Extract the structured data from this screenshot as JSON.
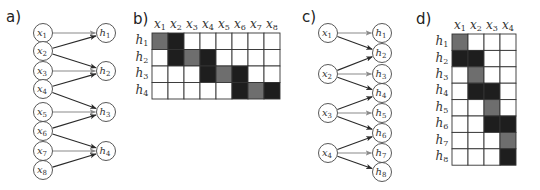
{
  "colors": {
    "dark": "#1e1e1e",
    "gray": "#6e6e6e",
    "empty": "#ffffff",
    "edge_dark": "#2a2a2a",
    "edge_gray": "#8a8a8a"
  },
  "panels": [
    {
      "id": "a",
      "label": "a)"
    },
    {
      "id": "b",
      "label": "b)"
    },
    {
      "id": "c",
      "label": "c)"
    },
    {
      "id": "d",
      "label": "d)"
    }
  ],
  "panel_a": {
    "inputs": [
      "x1",
      "x2",
      "x3",
      "x4",
      "x5",
      "x6",
      "x7",
      "x8"
    ],
    "outputs": [
      "h1",
      "h2",
      "h3",
      "h4"
    ],
    "edges": [
      {
        "from": "x1",
        "to": "h1",
        "shade": "gray"
      },
      {
        "from": "x2",
        "to": "h1",
        "shade": "dark"
      },
      {
        "from": "x2",
        "to": "h2",
        "shade": "dark"
      },
      {
        "from": "x3",
        "to": "h2",
        "shade": "gray"
      },
      {
        "from": "x4",
        "to": "h2",
        "shade": "dark"
      },
      {
        "from": "x4",
        "to": "h3",
        "shade": "dark"
      },
      {
        "from": "x5",
        "to": "h3",
        "shade": "gray"
      },
      {
        "from": "x6",
        "to": "h3",
        "shade": "dark"
      },
      {
        "from": "x6",
        "to": "h4",
        "shade": "dark"
      },
      {
        "from": "x7",
        "to": "h4",
        "shade": "gray"
      },
      {
        "from": "x8",
        "to": "h4",
        "shade": "dark"
      }
    ]
  },
  "panel_b": {
    "col_headers": [
      "x1",
      "x2",
      "x3",
      "x4",
      "x5",
      "x6",
      "x7",
      "x8"
    ],
    "row_headers": [
      "h1",
      "h2",
      "h3",
      "h4"
    ],
    "matrix": [
      [
        "gray",
        "dark",
        "empty",
        "empty",
        "empty",
        "empty",
        "empty",
        "empty"
      ],
      [
        "empty",
        "dark",
        "gray",
        "dark",
        "empty",
        "empty",
        "empty",
        "empty"
      ],
      [
        "empty",
        "empty",
        "empty",
        "dark",
        "gray",
        "dark",
        "empty",
        "empty"
      ],
      [
        "empty",
        "empty",
        "empty",
        "empty",
        "empty",
        "dark",
        "gray",
        "dark"
      ]
    ]
  },
  "panel_c": {
    "inputs": [
      "x1",
      "x2",
      "x3",
      "x4"
    ],
    "outputs": [
      "h1",
      "h2",
      "h3",
      "h4",
      "h5",
      "h6",
      "h7",
      "h8"
    ],
    "edges": [
      {
        "from": "x1",
        "to": "h1",
        "shade": "gray"
      },
      {
        "from": "x1",
        "to": "h2",
        "shade": "dark"
      },
      {
        "from": "x2",
        "to": "h2",
        "shade": "dark"
      },
      {
        "from": "x2",
        "to": "h3",
        "shade": "gray"
      },
      {
        "from": "x2",
        "to": "h4",
        "shade": "dark"
      },
      {
        "from": "x3",
        "to": "h4",
        "shade": "dark"
      },
      {
        "from": "x3",
        "to": "h5",
        "shade": "gray"
      },
      {
        "from": "x3",
        "to": "h6",
        "shade": "dark"
      },
      {
        "from": "x4",
        "to": "h6",
        "shade": "dark"
      },
      {
        "from": "x4",
        "to": "h7",
        "shade": "gray"
      },
      {
        "from": "x4",
        "to": "h8",
        "shade": "dark"
      }
    ]
  },
  "panel_d": {
    "col_headers": [
      "x1",
      "x2",
      "x3",
      "x4"
    ],
    "row_headers": [
      "h1",
      "h2",
      "h3",
      "h4",
      "h5",
      "h6",
      "h7",
      "h8"
    ],
    "matrix": [
      [
        "gray",
        "empty",
        "empty",
        "empty"
      ],
      [
        "dark",
        "dark",
        "empty",
        "empty"
      ],
      [
        "empty",
        "gray",
        "empty",
        "empty"
      ],
      [
        "empty",
        "dark",
        "dark",
        "empty"
      ],
      [
        "empty",
        "empty",
        "gray",
        "empty"
      ],
      [
        "empty",
        "empty",
        "dark",
        "dark"
      ],
      [
        "empty",
        "empty",
        "empty",
        "gray"
      ],
      [
        "empty",
        "empty",
        "empty",
        "dark"
      ]
    ]
  }
}
